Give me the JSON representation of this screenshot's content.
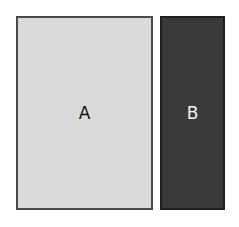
{
  "diagram": {
    "panels": [
      {
        "id": "A",
        "label": "A",
        "fill": "#dadada",
        "text_color": "#111111"
      },
      {
        "id": "B",
        "label": "B",
        "fill": "#3a3a3a",
        "text_color": "#f2f2f2"
      }
    ]
  }
}
